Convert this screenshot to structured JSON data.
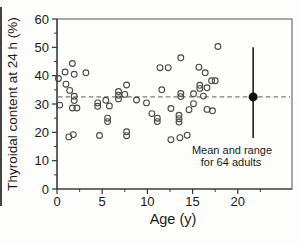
{
  "figure": {
    "y_axis_title": "Thyroidal content at 24 h (%)",
    "x_axis_title": "Age (y)",
    "annotation_line1": "Mean and range",
    "annotation_line2": "for 64 adults"
  },
  "chart_data": {
    "type": "scatter",
    "title": "",
    "xlabel": "Age (y)",
    "ylabel": "Thyroidal content at 24 h (%)",
    "xlim": [
      0,
      26
    ],
    "ylim": [
      0,
      60
    ],
    "x_major_ticks": [
      0,
      5,
      10,
      15,
      20
    ],
    "x_minor_ticks": [
      2.5,
      7.5,
      12.5,
      17.5,
      22.5
    ],
    "y_major_ticks": [
      0,
      10,
      20,
      30,
      40,
      50,
      60
    ],
    "y_minor_ticks": [
      5,
      15,
      25,
      35,
      45,
      55
    ],
    "grid": false,
    "legend": "none",
    "reference_line": {
      "y": 32.5,
      "style": "dashed",
      "color": "#7a7a7a"
    },
    "series": [
      {
        "name": "individual children",
        "marker": "open-circle",
        "marker_color": "#4a4a4a",
        "points": [
          [
            0.15,
            39.0
          ],
          [
            0.3,
            29.6
          ],
          [
            0.9,
            41.3
          ],
          [
            1.0,
            37.0
          ],
          [
            1.4,
            34.8
          ],
          [
            1.7,
            44.3
          ],
          [
            1.9,
            40.5
          ],
          [
            1.9,
            32.7
          ],
          [
            1.9,
            31.2
          ],
          [
            1.7,
            28.6
          ],
          [
            2.2,
            28.6
          ],
          [
            1.3,
            18.4
          ],
          [
            1.8,
            19.2
          ],
          [
            3.2,
            41.0
          ],
          [
            4.5,
            30.4
          ],
          [
            4.5,
            29.2
          ],
          [
            5.4,
            31.3
          ],
          [
            5.8,
            29.3
          ],
          [
            4.7,
            18.9
          ],
          [
            5.6,
            25.0
          ],
          [
            5.6,
            23.8
          ],
          [
            6.8,
            34.4
          ],
          [
            6.8,
            33.1
          ],
          [
            6.8,
            31.8
          ],
          [
            7.5,
            33.4
          ],
          [
            7.7,
            36.7
          ],
          [
            7.7,
            20.2
          ],
          [
            7.7,
            18.8
          ],
          [
            8.8,
            31.4
          ],
          [
            9.9,
            30.4
          ],
          [
            10.5,
            26.6
          ],
          [
            11.1,
            25.0
          ],
          [
            11.1,
            23.8
          ],
          [
            11.4,
            42.8
          ],
          [
            12.3,
            42.8
          ],
          [
            11.6,
            35.0
          ],
          [
            12.6,
            28.4
          ],
          [
            13.7,
            46.3
          ],
          [
            13.7,
            33.7
          ],
          [
            13.7,
            32.6
          ],
          [
            13.5,
            26.0
          ],
          [
            13.5,
            24.8
          ],
          [
            13.5,
            23.6
          ],
          [
            12.6,
            17.4
          ],
          [
            13.6,
            18.1
          ],
          [
            14.4,
            19.0
          ],
          [
            14.6,
            28.0
          ],
          [
            15.1,
            33.6
          ],
          [
            15.1,
            30.1
          ],
          [
            15.7,
            43.0
          ],
          [
            16.4,
            41.0
          ],
          [
            15.8,
            36.6
          ],
          [
            15.8,
            35.5
          ],
          [
            16.6,
            35.7
          ],
          [
            16.2,
            32.8
          ],
          [
            17.1,
            38.2
          ],
          [
            17.5,
            38.2
          ],
          [
            16.6,
            28.1
          ],
          [
            17.2,
            27.6
          ],
          [
            17.8,
            50.3
          ]
        ]
      },
      {
        "name": "adult mean and range",
        "marker": "filled-circle",
        "marker_color": "#111111",
        "mean_x": 21.7,
        "mean_y": 32.5,
        "range": [
          18,
          50
        ],
        "label": "Mean and range for 64 adults"
      }
    ],
    "colors": {
      "axis": "#333333",
      "frame": "#555555",
      "tick_label": "#1a1a1a",
      "background": "#fdfdfb"
    }
  }
}
